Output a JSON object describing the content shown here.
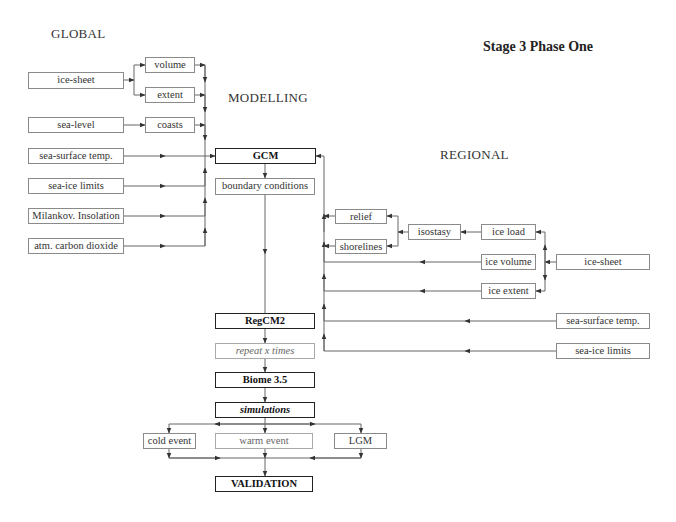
{
  "title": "Stage 3 Phase One",
  "section_labels": {
    "global": "GLOBAL",
    "modelling": "MODELLING",
    "regional": "REGIONAL"
  },
  "global_inputs": {
    "ice_sheet": "ice-sheet",
    "volume": "volume",
    "extent": "extent",
    "sea_level": "sea-level",
    "coasts": "coasts",
    "sea_surface_temp": "sea-surface temp.",
    "sea_ice_limits": "sea-ice limits",
    "milankovitch": "Milankov. Insolation",
    "carbon_dioxide": "atm. carbon dioxide"
  },
  "modelling": {
    "gcm": "GCM",
    "boundary_conditions": "boundary conditions",
    "regcm2": "RegCM2",
    "repeat": "repeat x times",
    "biome": "Biome 3.5",
    "simulations": "simulations",
    "cold_event": "cold event",
    "warm_event": "warm event",
    "lgm": "LGM",
    "validation": "VALIDATION"
  },
  "regional_inputs": {
    "relief": "relief",
    "shorelines": "shorelines",
    "isostasy": "isostasy",
    "ice_load": "ice load",
    "ice_volume": "ice volume",
    "ice_extent": "ice extent",
    "ice_sheet": "ice-sheet",
    "sea_surface_temp": "sea-surface temp.",
    "sea_ice_limits": "sea-ice limits"
  },
  "colors": {
    "line": "#666666",
    "box_border": "#8a8a8a",
    "bold_border": "#222222"
  }
}
